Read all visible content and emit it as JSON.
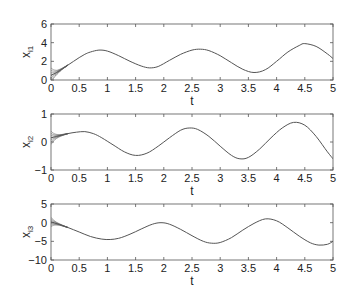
{
  "chart_data": [
    {
      "type": "line",
      "title": "",
      "xlabel": "t",
      "ylabel": "x_i1",
      "ylabel_main": "x",
      "ylabel_sub": "i1",
      "xlim": [
        0,
        5
      ],
      "ylim": [
        0,
        6
      ],
      "xticks": [
        "0",
        "0.5",
        "1",
        "1.5",
        "2",
        "2.5",
        "3",
        "3.5",
        "4",
        "4.5",
        "5"
      ],
      "yticks": [
        "0",
        "2",
        "4",
        "6"
      ],
      "grid": false,
      "series": [
        {
          "name": "x_i1",
          "x": [
            0,
            0.1,
            0.2,
            0.3,
            0.4,
            0.5,
            0.6,
            0.7,
            0.85,
            1.0,
            1.2,
            1.4,
            1.6,
            1.75,
            1.9,
            2.1,
            2.3,
            2.5,
            2.65,
            2.8,
            3.0,
            3.2,
            3.4,
            3.6,
            3.8,
            4.0,
            4.2,
            4.4,
            4.5,
            4.7,
            4.9,
            5.0
          ],
          "values": [
            0.5,
            0.8,
            1.2,
            1.6,
            2.0,
            2.4,
            2.75,
            3.0,
            3.2,
            3.1,
            2.6,
            2.0,
            1.5,
            1.3,
            1.45,
            2.1,
            2.75,
            3.2,
            3.3,
            3.15,
            2.6,
            1.85,
            1.15,
            0.8,
            1.1,
            2.0,
            3.0,
            3.7,
            3.9,
            3.6,
            2.8,
            2.3
          ]
        }
      ]
    },
    {
      "type": "line",
      "title": "",
      "xlabel": "t",
      "ylabel": "x_i2",
      "ylabel_main": "x",
      "ylabel_sub": "i2",
      "xlim": [
        0,
        5
      ],
      "ylim": [
        -1,
        1
      ],
      "xticks": [
        "0",
        "0.5",
        "1",
        "1.5",
        "2",
        "2.5",
        "3",
        "3.5",
        "4",
        "4.5",
        "5"
      ],
      "yticks": [
        "-1",
        "0",
        "1"
      ],
      "grid": false,
      "series": [
        {
          "name": "x_i2",
          "x": [
            0,
            0.1,
            0.2,
            0.3,
            0.45,
            0.6,
            0.75,
            0.9,
            1.1,
            1.3,
            1.5,
            1.7,
            1.9,
            2.1,
            2.3,
            2.45,
            2.6,
            2.8,
            3.0,
            3.2,
            3.35,
            3.5,
            3.7,
            3.9,
            4.1,
            4.3,
            4.5,
            4.7,
            4.9,
            5.0
          ],
          "values": [
            0.15,
            0.2,
            0.25,
            0.3,
            0.35,
            0.37,
            0.3,
            0.15,
            -0.1,
            -0.35,
            -0.48,
            -0.4,
            -0.15,
            0.15,
            0.42,
            0.5,
            0.45,
            0.2,
            -0.15,
            -0.48,
            -0.6,
            -0.55,
            -0.25,
            0.15,
            0.5,
            0.7,
            0.6,
            0.2,
            -0.35,
            -0.6
          ]
        }
      ],
      "annotations": [
        "transient oscillation bundle near t=0 spanning approx -0.05 to 0.9"
      ]
    },
    {
      "type": "line",
      "title": "",
      "xlabel": "t",
      "ylabel": "x_i3",
      "ylabel_main": "x",
      "ylabel_sub": "i3",
      "xlim": [
        0,
        5
      ],
      "ylim": [
        -10,
        5
      ],
      "xticks": [
        "0",
        "0.5",
        "1",
        "1.5",
        "2",
        "2.5",
        "3",
        "3.5",
        "4",
        "4.5",
        "5"
      ],
      "yticks": [
        "-10",
        "-5",
        "0",
        "5"
      ],
      "grid": false,
      "series": [
        {
          "name": "x_i3",
          "x": [
            0,
            0.15,
            0.3,
            0.5,
            0.7,
            0.9,
            1.05,
            1.2,
            1.4,
            1.6,
            1.8,
            1.95,
            2.1,
            2.3,
            2.5,
            2.7,
            2.85,
            3.0,
            3.2,
            3.4,
            3.6,
            3.8,
            4.0,
            4.2,
            4.4,
            4.6,
            4.75,
            4.9,
            5.0
          ],
          "values": [
            0.2,
            -0.5,
            -1.3,
            -2.5,
            -3.7,
            -4.4,
            -4.5,
            -4.2,
            -3.1,
            -1.7,
            -0.4,
            0.0,
            -0.4,
            -1.8,
            -3.5,
            -5.0,
            -5.5,
            -5.3,
            -4.0,
            -2.0,
            -0.2,
            1.0,
            0.5,
            -1.4,
            -3.6,
            -5.4,
            -6.0,
            -5.8,
            -5.0
          ]
        }
      ]
    }
  ]
}
